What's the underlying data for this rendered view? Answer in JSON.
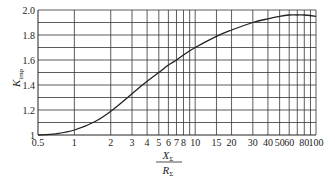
{
  "chart_data": {
    "type": "line",
    "title": "",
    "xlabel": "X_Σ / R_Σ",
    "xlabel_num": "X",
    "xlabel_den": "R",
    "xlabel_sub": "Σ",
    "ylabel": "K_imp",
    "ylabel_main": "K",
    "ylabel_sub": "imp",
    "xscale": "log",
    "xlim": [
      0.5,
      100
    ],
    "ylim": [
      1.0,
      2.0
    ],
    "grid": true,
    "x_ticks": [
      0.5,
      1,
      2,
      3,
      4,
      5,
      6,
      7,
      8,
      10,
      15,
      20,
      30,
      40,
      50,
      60,
      80,
      100
    ],
    "x_tick_labels": [
      "0.5",
      "1",
      "2",
      "3",
      "4",
      "5",
      "6",
      "7",
      "8",
      "10",
      "15",
      "20",
      "30",
      "40",
      "50",
      "60",
      "80",
      "100"
    ],
    "x_gridlines": [
      1,
      2,
      3,
      4,
      5,
      6,
      7,
      8,
      9,
      10,
      15,
      20,
      30,
      40,
      50,
      60,
      70,
      80,
      90,
      100
    ],
    "y_ticks": [
      1.0,
      1.2,
      1.4,
      1.6,
      1.8,
      2.0
    ],
    "y_tick_labels": [
      "1",
      "1.2",
      "1.4",
      "1.6",
      "1.8",
      "2.0"
    ],
    "y_gridlines": [
      1.1,
      1.2,
      1.3,
      1.4,
      1.5,
      1.6,
      1.7,
      1.8,
      1.9,
      2.0
    ],
    "series": [
      {
        "name": "K_imp",
        "x": [
          0.5,
          0.7,
          1,
          1.5,
          2,
          3,
          4,
          5,
          6,
          7,
          8,
          10,
          15,
          20,
          30,
          40,
          50,
          60,
          70,
          80,
          100
        ],
        "values": [
          1.0,
          1.01,
          1.04,
          1.11,
          1.19,
          1.33,
          1.43,
          1.5,
          1.56,
          1.6,
          1.64,
          1.7,
          1.79,
          1.84,
          1.9,
          1.93,
          1.95,
          1.96,
          1.96,
          1.96,
          1.95
        ]
      }
    ]
  },
  "layout": {
    "plot_left": 38,
    "plot_right": 316,
    "plot_top": 10,
    "plot_bottom": 135
  }
}
